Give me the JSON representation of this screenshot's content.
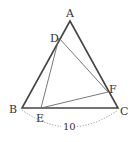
{
  "diagram": {
    "type": "geometry-triangle",
    "points": {
      "A": {
        "label": "A",
        "x": 70,
        "y": 21
      },
      "B": {
        "label": "B",
        "x": 22,
        "y": 108
      },
      "C": {
        "label": "C",
        "x": 118,
        "y": 108
      },
      "D": {
        "label": "D",
        "x": 59,
        "y": 38
      },
      "E": {
        "label": "E",
        "x": 41,
        "y": 108
      },
      "F": {
        "label": "F",
        "x": 108,
        "y": 92
      }
    },
    "segments": [
      {
        "from": "A",
        "to": "B",
        "style": "thick"
      },
      {
        "from": "B",
        "to": "C",
        "style": "thick"
      },
      {
        "from": "C",
        "to": "A",
        "style": "thick"
      },
      {
        "from": "D",
        "to": "E",
        "style": "thin"
      },
      {
        "from": "E",
        "to": "F",
        "style": "thin"
      },
      {
        "from": "F",
        "to": "D",
        "style": "thin"
      }
    ],
    "measure": {
      "from": "B",
      "to": "C",
      "label": "10",
      "style": "dotted-arc"
    },
    "colors": {
      "thick": "#444444",
      "thin": "#666666",
      "dotted": "#888888",
      "text": "#333333"
    }
  }
}
